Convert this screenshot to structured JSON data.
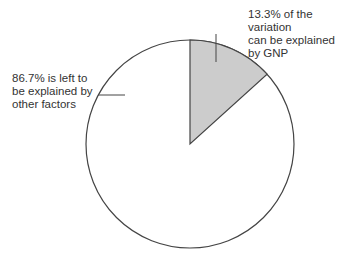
{
  "chart_data": {
    "type": "pie",
    "title": "",
    "slices": [
      {
        "label": "Explained by GNP",
        "value": 13.3,
        "color": "#cccccc"
      },
      {
        "label": "Other factors",
        "value": 86.7,
        "color": "#ffffff"
      }
    ],
    "annotations": [
      {
        "text": "13.3% of the variation can be explained by GNP",
        "target": "Explained by GNP"
      },
      {
        "text": "86.7% is left to be explained by other factors",
        "target": "Other factors"
      }
    ]
  },
  "labels": {
    "explained_line1": "13.3% of the variation",
    "explained_line2": "can be explained by GNP",
    "left_line1": "86.7% is left to",
    "left_line2": "be explained by",
    "left_line3": "other factors"
  },
  "colors": {
    "explained_fill": "#cccccc",
    "outline": "#444444"
  }
}
